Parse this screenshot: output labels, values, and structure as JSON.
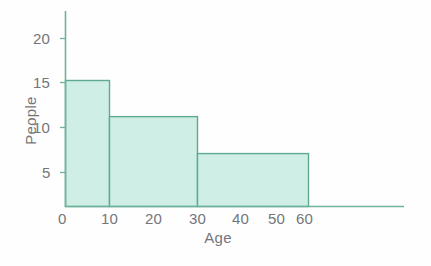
{
  "chart_data": {
    "type": "bar",
    "title": "",
    "subtitle": "",
    "xlabel": "Age",
    "ylabel": "People",
    "grid": false,
    "legend": "none",
    "orientation": "vertical",
    "style": "histogram",
    "bin_edges": [
      0,
      10,
      30,
      60
    ],
    "categories": [
      "0-10",
      "10-30",
      "30-60"
    ],
    "values": [
      15,
      10.7,
      6.3
    ],
    "xlim": [
      0,
      60
    ],
    "ylim": [
      0,
      23
    ],
    "xticks": [
      0,
      10,
      20,
      30,
      40,
      50,
      60
    ],
    "xtick_labels": [
      "0",
      "10",
      "20",
      "30",
      "40",
      "50",
      "60"
    ],
    "yticks": [
      5,
      10,
      15,
      20
    ],
    "ytick_labels": [
      "5",
      "10",
      "15",
      "20"
    ],
    "series": [
      {
        "name": "People",
        "bars": [
          {
            "label": "0-10",
            "x_start": 0,
            "x_end": 10,
            "value": 15
          },
          {
            "label": "10-30",
            "x_start": 10,
            "x_end": 30,
            "value": 10.7
          },
          {
            "label": "30-60",
            "x_start": 30,
            "x_end": 60,
            "value": 6.3
          }
        ]
      }
    ],
    "colors": {
      "bar_fill": "#cfeee6",
      "bar_stroke": "#5ea98f",
      "axis": "#6fb39c",
      "text": "#74767a",
      "background": "#fefefe"
    }
  },
  "axes": {
    "x_title": "Age",
    "y_title": "People",
    "x_tick_labels": [
      "0",
      "10",
      "20",
      "30",
      "40",
      "50",
      "60"
    ],
    "y_tick_labels": [
      "5",
      "10",
      "15",
      "20"
    ]
  }
}
